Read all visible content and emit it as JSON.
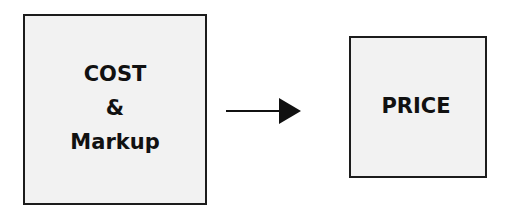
{
  "diagram": {
    "type": "flow",
    "nodes": [
      {
        "id": "cost-markup",
        "lines": [
          "COST",
          "&",
          "Markup"
        ]
      },
      {
        "id": "price",
        "lines": [
          "PRICE"
        ]
      }
    ],
    "edges": [
      {
        "from": "cost-markup",
        "to": "price",
        "style": "solid-arrow"
      }
    ],
    "colors": {
      "box_fill": "#f2f2f2",
      "box_border": "#1c1c1c",
      "text": "#111111",
      "arrow": "#111111"
    }
  }
}
